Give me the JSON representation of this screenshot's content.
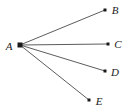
{
  "diagram": {
    "type": "star-graph",
    "background_color": "#ffffff",
    "edge_color": "#4a4a4a",
    "node_color": "#1a1a1a",
    "label_color": "#1a1a1a",
    "edge_width": 0.9,
    "canvas": {
      "width": 126,
      "height": 109
    },
    "center": {
      "id": "A",
      "label": "A",
      "x": 20,
      "y": 45,
      "marker": "square",
      "marker_size": 5,
      "label_x": 9,
      "label_y": 46
    },
    "nodes": [
      {
        "id": "B",
        "label": "B",
        "x": 105,
        "y": 10,
        "marker": "square",
        "marker_size": 3,
        "label_x": 115,
        "label_y": 10
      },
      {
        "id": "C",
        "label": "C",
        "x": 108,
        "y": 44,
        "marker": "square",
        "marker_size": 3,
        "label_x": 118,
        "label_y": 44
      },
      {
        "id": "D",
        "label": "D",
        "x": 105,
        "y": 71,
        "marker": "square",
        "marker_size": 3,
        "label_x": 115,
        "label_y": 72
      },
      {
        "id": "E",
        "label": "E",
        "x": 89,
        "y": 100,
        "marker": "square",
        "marker_size": 3,
        "label_x": 99,
        "label_y": 101
      }
    ],
    "edges": [
      {
        "id": "AB",
        "from": "A",
        "to": "B",
        "x1": 20,
        "y1": 45,
        "x2": 105,
        "y2": 10
      },
      {
        "id": "AC",
        "from": "A",
        "to": "C",
        "x1": 20,
        "y1": 45,
        "x2": 108,
        "y2": 44
      },
      {
        "id": "AD",
        "from": "A",
        "to": "D",
        "x1": 20,
        "y1": 45,
        "x2": 105,
        "y2": 71
      },
      {
        "id": "AE",
        "from": "A",
        "to": "E",
        "x1": 20,
        "y1": 45,
        "x2": 89,
        "y2": 100
      }
    ]
  }
}
